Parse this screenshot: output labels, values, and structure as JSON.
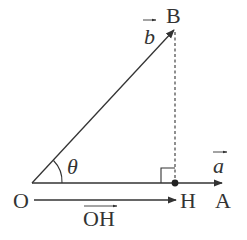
{
  "diagram": {
    "type": "vector-projection",
    "colors": {
      "stroke": "#333333",
      "background": "#ffffff"
    },
    "points": {
      "O": {
        "label": "O"
      },
      "A": {
        "label": "A"
      },
      "B": {
        "label": "B"
      },
      "H": {
        "label": "H"
      }
    },
    "vectors": {
      "a": {
        "label": "a",
        "arrow": "→"
      },
      "b": {
        "label": "b",
        "arrow": "→"
      },
      "OH": {
        "label": "OH",
        "arrow": "→"
      }
    },
    "angle": {
      "label": "θ"
    },
    "annotations": {
      "right_angle_at": "H",
      "perpendicular": "BH (dashed)"
    }
  }
}
